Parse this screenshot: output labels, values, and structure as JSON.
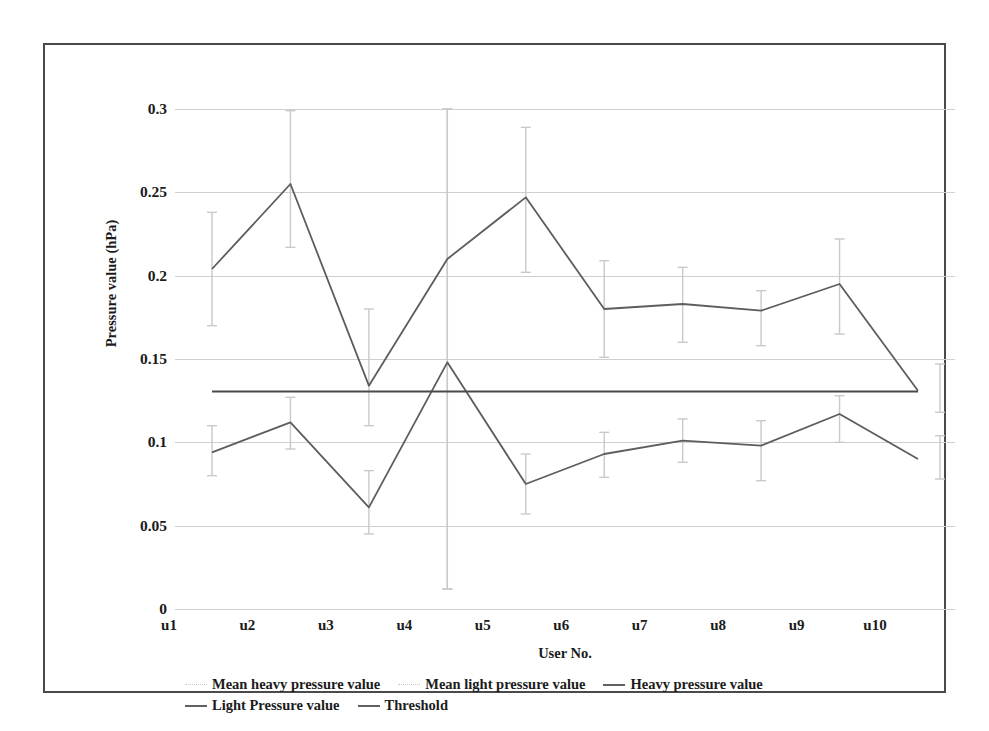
{
  "chart_data": {
    "type": "line",
    "title": "",
    "xlabel": "User No.",
    "ylabel": "Pressure value (hPa)",
    "categories": [
      "u1",
      "u2",
      "u3",
      "u4",
      "u5",
      "u6",
      "u7",
      "u8",
      "u9",
      "u10"
    ],
    "ylim": [
      0,
      0.3
    ],
    "yticks": [
      "0",
      "0.05",
      "0.1",
      "0.15",
      "0.2",
      "0.25",
      "0.3"
    ],
    "ytick_values": [
      0,
      0.05,
      0.1,
      0.15,
      0.2,
      0.25,
      0.3
    ],
    "grid": true,
    "legend_position": "bottom",
    "series": [
      {
        "name": "Mean heavy pressure value",
        "style": "error-bar",
        "color": "#c9c9c9",
        "values": [
          0.204,
          0.255,
          0.134,
          0.21,
          0.247,
          0.18,
          0.183,
          0.179,
          0.195,
          0.131
        ],
        "err_low": [
          0.17,
          0.217,
          0.11,
          0.012,
          0.202,
          0.151,
          0.16,
          0.158,
          0.165,
          0.118
        ],
        "err_high": [
          0.238,
          0.299,
          0.18,
          0.3,
          0.289,
          0.209,
          0.205,
          0.191,
          0.222,
          0.147
        ]
      },
      {
        "name": "Mean light pressure value",
        "style": "error-bar",
        "color": "#c9c9c9",
        "values": [
          0.094,
          0.112,
          0.061,
          0.148,
          0.075,
          0.093,
          0.101,
          0.098,
          0.117,
          0.09
        ],
        "err_low": [
          0.08,
          0.096,
          0.045,
          0.012,
          0.057,
          0.079,
          0.088,
          0.077,
          0.1,
          0.078
        ],
        "err_high": [
          0.11,
          0.127,
          0.083,
          0.3,
          0.093,
          0.106,
          0.114,
          0.113,
          0.128,
          0.104
        ]
      },
      {
        "name": "Heavy pressure value",
        "style": "line",
        "color": "#5d5d5d",
        "values": [
          0.204,
          0.255,
          0.134,
          0.21,
          0.247,
          0.18,
          0.183,
          0.179,
          0.195,
          0.131
        ]
      },
      {
        "name": "Light Pressure value",
        "style": "line",
        "color": "#5d5d5d",
        "values": [
          0.094,
          0.112,
          0.061,
          0.148,
          0.075,
          0.093,
          0.101,
          0.098,
          0.117,
          0.09
        ]
      },
      {
        "name": "Threshold",
        "style": "constant-line",
        "color": "#4a4a4a",
        "value": 0.1305
      }
    ]
  },
  "legend": {
    "rows": [
      [
        {
          "label": "Mean heavy pressure value",
          "mark": "faint"
        },
        {
          "label": "Mean light pressure value",
          "mark": "faint"
        },
        {
          "label": "Heavy pressure value",
          "mark": "solid"
        }
      ],
      [
        {
          "label": "Light Pressure value",
          "mark": "solid"
        },
        {
          "label": "Threshold",
          "mark": "solid"
        }
      ]
    ]
  }
}
